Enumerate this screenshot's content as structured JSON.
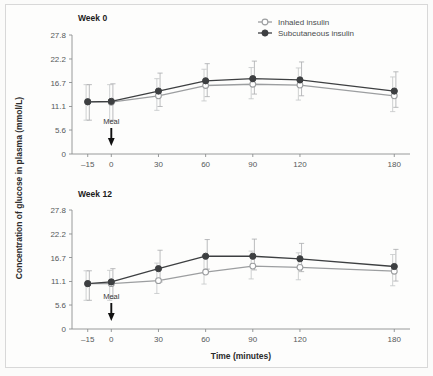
{
  "figure": {
    "y_axis_title": "Concentration of glucose in plasma (mmol/L)",
    "x_axis_title": "Time (minutes)"
  },
  "legend": {
    "position": "top-right",
    "entries": [
      {
        "label": "Inhaled insulin",
        "marker": "open-circle-marker",
        "color": "#9c9ea0"
      },
      {
        "label": "Subcutaneous insulin",
        "marker": "filled-circle-marker",
        "color": "#3d3f41"
      }
    ]
  },
  "annotations": {
    "meal_label": "Meal",
    "meal_time": 0
  },
  "ticks": {
    "y": [
      "0",
      "5.6",
      "11.1",
      "16.7",
      "22.2",
      "27.8"
    ],
    "x": [
      "–15",
      "0",
      "30",
      "60",
      "90",
      "120",
      "180"
    ]
  },
  "chart_data": [
    {
      "type": "line",
      "title": "Week 0",
      "xlabel": "Time (minutes)",
      "ylabel": "Concentration of glucose in plasma (mmol/L)",
      "x": [
        -15,
        0,
        30,
        60,
        90,
        120,
        180
      ],
      "xlim": [
        -25,
        190
      ],
      "ylim": [
        0,
        27.8
      ],
      "yticks": [
        0,
        5.6,
        11.1,
        16.7,
        22.2,
        27.8
      ],
      "xticks": [
        -15,
        0,
        30,
        60,
        90,
        120,
        180
      ],
      "grid": false,
      "legend": "top-right",
      "series": [
        {
          "name": "Inhaled insulin",
          "color": "#9c9ea0",
          "marker": "open-circle",
          "values": [
            12.2,
            12.1,
            13.6,
            16.0,
            16.3,
            16.1,
            13.6
          ],
          "err_low": [
            4.3,
            4.4,
            3.4,
            3.6,
            3.4,
            3.5,
            3.7
          ],
          "err_high": [
            4.0,
            4.1,
            4.0,
            3.8,
            3.9,
            4.0,
            4.4
          ]
        },
        {
          "name": "Subcutaneous insulin",
          "color": "#3d3f41",
          "marker": "filled-circle",
          "values": [
            12.2,
            12.3,
            14.7,
            17.1,
            17.6,
            17.3,
            14.7
          ],
          "err_low": [
            4.3,
            4.4,
            3.6,
            3.7,
            3.6,
            3.7,
            3.8
          ],
          "err_high": [
            4.0,
            4.1,
            4.2,
            4.0,
            4.1,
            4.2,
            4.5
          ]
        }
      ]
    },
    {
      "type": "line",
      "title": "Week 12",
      "xlabel": "Time (minutes)",
      "ylabel": "Concentration of glucose in plasma (mmol/L)",
      "x": [
        -15,
        0,
        30,
        60,
        90,
        120,
        180
      ],
      "xlim": [
        -25,
        190
      ],
      "ylim": [
        0,
        27.8
      ],
      "yticks": [
        0,
        5.6,
        11.1,
        16.7,
        22.2,
        27.8
      ],
      "xticks": [
        -15,
        0,
        30,
        60,
        90,
        120,
        180
      ],
      "grid": false,
      "legend": "none",
      "series": [
        {
          "name": "Inhaled insulin",
          "color": "#9c9ea0",
          "marker": "open-circle",
          "values": [
            10.6,
            10.6,
            11.3,
            13.3,
            14.7,
            14.4,
            13.5
          ],
          "err_low": [
            3.9,
            3.9,
            3.0,
            2.8,
            3.0,
            2.9,
            3.4
          ],
          "err_high": [
            3.0,
            3.1,
            4.1,
            3.8,
            3.5,
            3.4,
            3.9
          ]
        },
        {
          "name": "Subcutaneous insulin",
          "color": "#3d3f41",
          "marker": "filled-circle",
          "values": [
            10.6,
            11.0,
            14.1,
            17.0,
            17.0,
            16.4,
            14.6
          ],
          "err_low": [
            3.9,
            3.9,
            3.1,
            3.0,
            3.2,
            3.0,
            3.4
          ],
          "err_high": [
            3.0,
            3.1,
            4.3,
            3.9,
            4.0,
            3.6,
            4.0
          ]
        }
      ]
    }
  ]
}
